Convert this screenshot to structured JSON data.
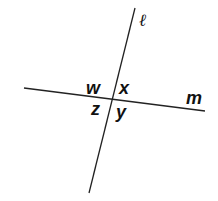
{
  "diagram": {
    "type": "intersecting-lines",
    "lines": [
      {
        "name": "ℓ",
        "from": [
          135,
          8
        ],
        "to": [
          89,
          193
        ]
      },
      {
        "name": "m",
        "from": [
          24,
          88
        ],
        "to": [
          205,
          111
        ]
      }
    ],
    "intersection": [
      114,
      99
    ],
    "angle_labels": {
      "w": "w",
      "x": "x",
      "z": "z",
      "y": "y"
    },
    "line_labels": {
      "l": "ℓ",
      "m": "m"
    }
  }
}
